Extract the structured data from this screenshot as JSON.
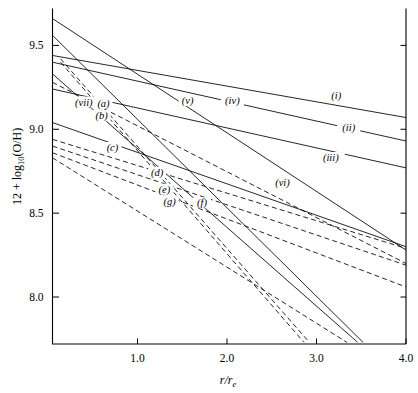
{
  "chart_data": {
    "type": "line",
    "title": "",
    "xlabel": "r/r_e",
    "ylabel": "12 + log10(O/H)",
    "xlim": [
      0.05,
      4.0
    ],
    "ylim": [
      7.72,
      9.72
    ],
    "xticks": [
      1.0,
      2.0,
      3.0,
      4.0
    ],
    "xticklabels": [
      "1.0",
      "2.0",
      "3.0",
      "4.0"
    ],
    "yticks": [
      8.0,
      8.5,
      9.0,
      9.5
    ],
    "yticklabels": [
      "8.0",
      "8.5",
      "9.0",
      "9.5"
    ],
    "grid": false,
    "legend_position": "inline-labels",
    "series": [
      {
        "name": "(i)",
        "style": "solid",
        "x": [
          0.05,
          4.0
        ],
        "y": [
          9.44,
          9.07
        ],
        "label_x": 3.22,
        "label_y": 9.19
      },
      {
        "name": "(ii)",
        "style": "solid",
        "x": [
          0.05,
          4.0
        ],
        "y": [
          9.4,
          8.93
        ],
        "label_x": 3.36,
        "label_y": 9.0
      },
      {
        "name": "(iii)",
        "style": "solid",
        "x": [
          0.05,
          4.0
        ],
        "y": [
          9.24,
          8.77
        ],
        "label_x": 3.16,
        "label_y": 8.82
      },
      {
        "name": "(iv)",
        "style": "solid",
        "x": [
          0.05,
          4.0
        ],
        "y": [
          9.66,
          8.28
        ],
        "label_x": 2.06,
        "label_y": 9.16
      },
      {
        "name": "(v)",
        "style": "solid",
        "x": [
          0.05,
          3.52
        ],
        "y": [
          9.56,
          7.73
        ],
        "label_x": 1.56,
        "label_y": 9.16
      },
      {
        "name": "(vi)",
        "style": "solid",
        "x": [
          0.05,
          4.0
        ],
        "y": [
          9.04,
          8.3
        ],
        "label_x": 2.62,
        "label_y": 8.67
      },
      {
        "name": "(vii)",
        "style": "solid",
        "x": [
          0.05,
          3.46
        ],
        "y": [
          9.33,
          7.73
        ],
        "label_x": 0.4,
        "label_y": 9.15
      },
      {
        "name": "(a)",
        "style": "dashed",
        "x": [
          0.14,
          2.92
        ],
        "y": [
          9.42,
          7.73
        ],
        "label_x": 0.62,
        "label_y": 9.14
      },
      {
        "name": "(b)",
        "style": "dashed",
        "x": [
          0.14,
          2.86
        ],
        "y": [
          9.4,
          7.73
        ],
        "label_x": 0.6,
        "label_y": 9.07
      },
      {
        "name": "(c)",
        "style": "dashed",
        "x": [
          0.05,
          4.0
        ],
        "y": [
          9.28,
          8.2
        ],
        "label_x": 0.72,
        "label_y": 8.88
      },
      {
        "name": "(d)",
        "style": "dashed",
        "x": [
          0.05,
          4.0
        ],
        "y": [
          8.94,
          8.29
        ],
        "label_x": 1.22,
        "label_y": 8.73
      },
      {
        "name": "(e)",
        "style": "dashed",
        "x": [
          0.05,
          4.0
        ],
        "y": [
          8.9,
          8.19
        ],
        "label_x": 1.3,
        "label_y": 8.63
      },
      {
        "name": "(f)",
        "style": "dashed",
        "x": [
          0.05,
          4.0
        ],
        "y": [
          8.86,
          8.06
        ],
        "label_x": 1.72,
        "label_y": 8.55
      },
      {
        "name": "(g)",
        "style": "dashed",
        "x": [
          0.05,
          3.34
        ],
        "y": [
          8.83,
          7.73
        ],
        "label_x": 1.36,
        "label_y": 8.56
      }
    ]
  },
  "axes": {
    "y_axis_label": "12 + log",
    "y_axis_label_sub": "10",
    "y_axis_label_rest": "(O/H)",
    "x_axis_label_main": "r/r",
    "x_axis_label_sub": "e"
  }
}
